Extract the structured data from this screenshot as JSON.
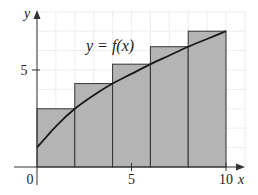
{
  "chart_data": {
    "type": "bar",
    "subtype": "riemann-sum-right-endpoints",
    "title": "",
    "xlabel": "x",
    "ylabel": "y",
    "curve_label": "y = f(x)",
    "x_ticks": [
      {
        "value": 0,
        "label": "0"
      },
      {
        "value": 5,
        "label": "5"
      },
      {
        "value": 10,
        "label": "10"
      }
    ],
    "y_ticks": [
      {
        "value": 5,
        "label": "5"
      }
    ],
    "xlim": [
      0,
      10.8
    ],
    "ylim": [
      0,
      8
    ],
    "grid": true,
    "rectangles": [
      {
        "x0": 0,
        "x1": 2,
        "height": 3.0
      },
      {
        "x0": 2,
        "x1": 4,
        "height": 4.3
      },
      {
        "x0": 4,
        "x1": 6,
        "height": 5.3
      },
      {
        "x0": 6,
        "x1": 8,
        "height": 6.2
      },
      {
        "x0": 8,
        "x1": 10,
        "height": 7.0
      }
    ],
    "curve": {
      "x": [
        0,
        1,
        2,
        3,
        4,
        5,
        6,
        7,
        8,
        9,
        10
      ],
      "y": [
        1.0,
        2.1,
        3.0,
        3.7,
        4.3,
        4.8,
        5.3,
        5.75,
        6.2,
        6.6,
        7.0
      ]
    }
  },
  "colors": {
    "bar_fill": "#b4b4b4",
    "bar_stroke": "#333333",
    "curve": "#1a1a1a",
    "grid": "#dcdcdc",
    "axis": "#333333"
  }
}
